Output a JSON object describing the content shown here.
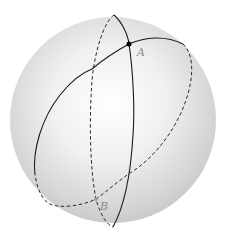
{
  "figure": {
    "sphere": {
      "cx": 113,
      "cy": 120,
      "r": 103,
      "highlight_color": "#ffffff",
      "edge_color": "#bdbdbd"
    },
    "line_color": "#1a1a1a",
    "points": [
      {
        "name": "A",
        "x": 129,
        "y": 44,
        "label": "A",
        "label_x": 137,
        "label_y": 47,
        "visible": true
      },
      {
        "name": "B",
        "x": 96,
        "y": 199,
        "label": "B",
        "label_x": 100,
        "label_y": 201,
        "visible": false
      }
    ],
    "great_circles": [
      {
        "name": "meridian",
        "front": "solid",
        "back": "dashed"
      },
      {
        "name": "tilted-circle",
        "front": "solid",
        "back": "dashed"
      }
    ]
  }
}
